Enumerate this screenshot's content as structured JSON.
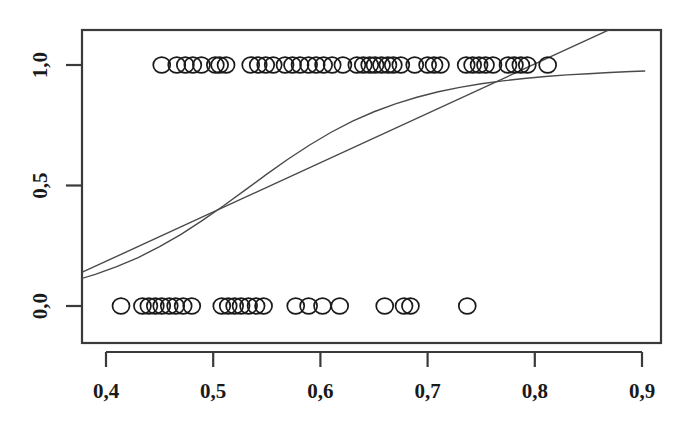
{
  "chart_data": {
    "type": "scatter",
    "title": "",
    "subtitle": "",
    "xlabel": "",
    "ylabel": "",
    "xlim": [
      0.365,
      0.905
    ],
    "ylim": [
      -0.08,
      1.1
    ],
    "grid": false,
    "legend": null,
    "decimal_separator": ",",
    "x_ticks": [
      0.4,
      0.5,
      0.6,
      0.7,
      0.8,
      0.9
    ],
    "x_tick_labels": [
      "0,4",
      "0,5",
      "0,6",
      "0,7",
      "0,8",
      "0,9"
    ],
    "y_ticks": [
      0.0,
      0.5,
      1.0
    ],
    "y_tick_labels": [
      "0,0",
      "0,5",
      "1,0"
    ],
    "series": [
      {
        "name": "observations-y1",
        "type": "scatter",
        "marker": "open-circle",
        "y": 1,
        "x": [
          0.452,
          0.466,
          0.474,
          0.481,
          0.489,
          0.502,
          0.506,
          0.512,
          0.535,
          0.542,
          0.549,
          0.556,
          0.567,
          0.574,
          0.581,
          0.589,
          0.596,
          0.603,
          0.611,
          0.621,
          0.634,
          0.64,
          0.646,
          0.651,
          0.657,
          0.663,
          0.668,
          0.675,
          0.688,
          0.7,
          0.706,
          0.712,
          0.736,
          0.742,
          0.748,
          0.754,
          0.761,
          0.775,
          0.781,
          0.787,
          0.793,
          0.812
        ]
      },
      {
        "name": "observations-y0",
        "type": "scatter",
        "marker": "open-circle",
        "y": 0,
        "x": [
          0.414,
          0.434,
          0.44,
          0.446,
          0.452,
          0.459,
          0.465,
          0.472,
          0.48,
          0.508,
          0.514,
          0.52,
          0.526,
          0.533,
          0.54,
          0.547,
          0.577,
          0.589,
          0.602,
          0.618,
          0.66,
          0.678,
          0.684,
          0.737
        ]
      },
      {
        "name": "logistic-fit",
        "type": "line",
        "description": "sigmoid probability curve",
        "points": [
          [
            0.368,
            0.102
          ],
          [
            0.39,
            0.131
          ],
          [
            0.41,
            0.163
          ],
          [
            0.43,
            0.201
          ],
          [
            0.45,
            0.246
          ],
          [
            0.47,
            0.297
          ],
          [
            0.49,
            0.355
          ],
          [
            0.51,
            0.417
          ],
          [
            0.53,
            0.482
          ],
          [
            0.55,
            0.547
          ],
          [
            0.57,
            0.61
          ],
          [
            0.59,
            0.668
          ],
          [
            0.61,
            0.721
          ],
          [
            0.63,
            0.767
          ],
          [
            0.65,
            0.806
          ],
          [
            0.67,
            0.839
          ],
          [
            0.69,
            0.866
          ],
          [
            0.71,
            0.889
          ],
          [
            0.73,
            0.907
          ],
          [
            0.75,
            0.922
          ],
          [
            0.77,
            0.934
          ],
          [
            0.79,
            0.944
          ],
          [
            0.81,
            0.952
          ],
          [
            0.83,
            0.959
          ],
          [
            0.85,
            0.964
          ],
          [
            0.87,
            0.969
          ],
          [
            0.89,
            0.973
          ],
          [
            0.903,
            0.975
          ]
        ]
      },
      {
        "name": "linear-fit",
        "type": "line",
        "description": "straight regression line",
        "points": [
          [
            0.368,
            0.12
          ],
          [
            0.903,
            1.215
          ]
        ]
      }
    ],
    "annotations": [
      {
        "label": "curve-intersection",
        "x": 0.531,
        "y": 0.475
      }
    ]
  },
  "axes": {
    "box_color": "#3a3a3a",
    "marker_color": "#1a1a1a",
    "curve_color": "#4a4a4a"
  }
}
